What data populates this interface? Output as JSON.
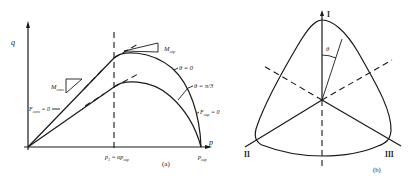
{
  "panel_a": {
    "caption": "(a)",
    "axis_y_label": "q",
    "axis_x_label": "p",
    "p_cap_label": "p",
    "p_cap_sub": "cap",
    "p1_label": "p",
    "p1_sub": "1",
    "p1_eq": " = αp",
    "p1_eq_sub": "cap",
    "curve_outer_label": "θ = 0",
    "curve_inner_label": "θ = π/3",
    "m_cons_label": "M",
    "m_cons_sub": "cons",
    "m_cap_label": "M",
    "m_cap_sub": "cap",
    "f_cons_label": "F",
    "f_cons_sub": "cons",
    "f_cons_eq": " = 0",
    "f_cap_label": "F",
    "f_cap_sub": "cap",
    "f_cap_eq": " = 0"
  },
  "panel_b": {
    "caption": "(b)",
    "axis_I": "I",
    "axis_II": "II",
    "axis_III": "III",
    "angle_label": "θ"
  },
  "colors": {
    "ink": "#1a1a1a",
    "background": "#ffffff"
  }
}
